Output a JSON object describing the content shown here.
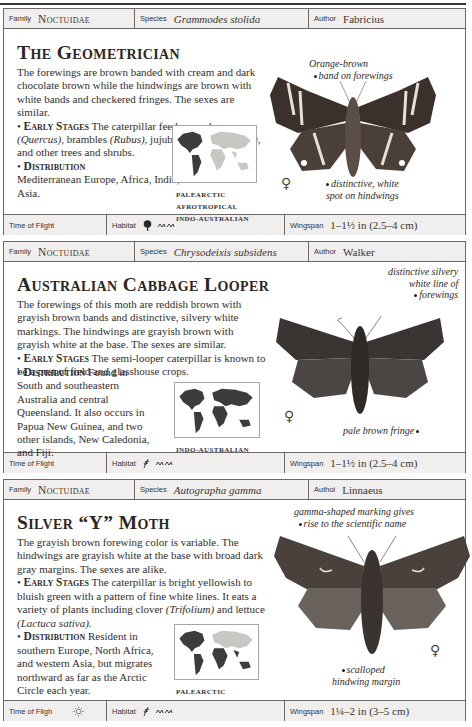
{
  "labels": {
    "family": "Family",
    "species": "Species",
    "author": "Author",
    "author_partial": "Authoi",
    "time_of_flight": "Time of Flight",
    "time_of_flight_partial": "Time of Fligh",
    "habitat": "Habitat",
    "wingspan": "Wingspan"
  },
  "entries": [
    {
      "family": "Noctuidae",
      "species": "Grammodes stolida",
      "author": "Fabricius",
      "title": "The Geometrician",
      "description": "The forewings are brown banded with cream and dark chocolate brown while the hindwings are brown with white bands and checkered fringes. The sexes are similar.",
      "early_stages_heading": "Early Stages",
      "early_stages_pre": "The caterpillar feeds on oaks",
      "early_stages_1_it": "(Quercus)",
      "early_stages_1_post": ", brambles",
      "early_stages_2_it": "(Rubus)",
      "early_stages_2_post": ", jujube",
      "early_stages_3_it": "(Zizyphus jujuba)",
      "early_stages_3_post": ", and other trees and shrubs.",
      "distribution_heading": "Distribution",
      "distribution": "Mediterranean Europe, Africa, India, and Southeast Asia.",
      "realms": [
        "PALEARCTIC",
        "AFROTROPICAL",
        "INDO-AUSTRALIAN"
      ],
      "annotations": [
        "Orange-brown",
        "band on forewings",
        "distinctive, white",
        "spot on hindwings"
      ],
      "sex_symbol": "♀",
      "time_of_flight_icons": [
        "moon-icon"
      ],
      "habitat_icons": [
        "tree-icon",
        "grassland-icon"
      ],
      "wingspan": "1–1½ in (2.5–4 cm)"
    },
    {
      "family": "Noctuidae",
      "species": "Chrysodeixis subsidens",
      "author": "Walker",
      "title": "Australian Cabbage Looper",
      "description": "The forewings of this moth are reddish brown with grayish brown bands and distinctive, silvery white markings. The hindwings are grayish brown with grayish white at the base. The sexes are similar.",
      "early_stages_heading": "Early Stages",
      "early_stages": "The semi-looper caterpillar is known to be a pest of field and glasshouse crops.",
      "distribution_heading": "Distribution",
      "distribution": "Found in South and southeastern Australia and central Queensland. It also occurs in Papua New Guinea, and two other islands, New Caledonia, and Fiji.",
      "realms": [
        "INDO-AUSTRALIAN"
      ],
      "annotations": [
        "distinctive silvery",
        "white line of",
        "forewings",
        "pale brown fringe"
      ],
      "sex_symbol": "♀",
      "time_of_flight_icons": [
        "moon-icon"
      ],
      "habitat_icons": [
        "crop-icon",
        "grassland-icon"
      ],
      "wingspan": "1–1½ in (2.5–4 cm)"
    },
    {
      "family": "Noctuidae",
      "species": "Autographa gamma",
      "author": "Linnaeus",
      "title": "Silver “Y” Moth",
      "description": "The grayish brown forewing color is variable. The hindwings are grayish white at the base with broad dark gray margins. The sexes are alike.",
      "early_stages_heading": "Early Stages",
      "early_stages_pre": "The caterpillar is bright yellowish to bluish green with a pattern of fine white lines. It eats a variety of plants including clover",
      "early_stages_1_it": "(Trifolium)",
      "early_stages_1_post": "and lettuce",
      "early_stages_2_it": "(Lactuca sativa).",
      "distribution_heading": "Distribution",
      "distribution": "Resident in southern Europe, North Africa, and western Asia, but migrates northward as far as the Arctic Circle each year.",
      "realms": [
        "PALEARCTIC"
      ],
      "annotations": [
        "gamma-shaped marking gives",
        "rise to the scientific name",
        "scalloped",
        "hindwing margin"
      ],
      "sex_symbol": "♀",
      "time_of_flight_icons": [
        "moon-icon",
        "sun-icon"
      ],
      "habitat_icons": [
        "crop-icon",
        "grassland-icon"
      ],
      "wingspan": "1¼–2 in (3–5 cm)"
    }
  ],
  "colors": {
    "header_bg": "#f0efed",
    "border": "#6a6764",
    "text": "#2a2623",
    "map_dark": "#3e3c3a",
    "map_light": "#c9c7c4"
  }
}
